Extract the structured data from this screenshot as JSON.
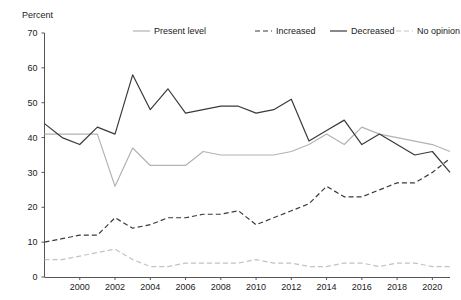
{
  "chart_data": {
    "type": "line",
    "title": "",
    "ylabel": "Percent",
    "xlabel": "",
    "ylim": [
      0,
      70
    ],
    "yticks": [
      0,
      10,
      20,
      30,
      40,
      50,
      60,
      70
    ],
    "xlim": [
      1998,
      2021
    ],
    "xticks": [
      2000,
      2002,
      2004,
      2006,
      2008,
      2010,
      2012,
      2014,
      2016,
      2018,
      2020
    ],
    "grid": false,
    "legend_position": "top",
    "x": [
      1998,
      1999,
      2000,
      2001,
      2002,
      2003,
      2004,
      2005,
      2006,
      2007,
      2008,
      2009,
      2010,
      2011,
      2012,
      2013,
      2014,
      2015,
      2016,
      2017,
      2018,
      2019,
      2020,
      2021
    ],
    "series": [
      {
        "name": "Present level",
        "key": "present_level",
        "style": "solid",
        "color": "#b3b3b3",
        "values": [
          41,
          41,
          41,
          41,
          26,
          37,
          32,
          32,
          32,
          36,
          35,
          35,
          35,
          35,
          36,
          38,
          41,
          38,
          43,
          41,
          40,
          39,
          38,
          36
        ]
      },
      {
        "name": "Increased",
        "key": "increased",
        "style": "dashed",
        "color": "#3a3a3a",
        "values": [
          10,
          11,
          12,
          12,
          17,
          14,
          15,
          17,
          17,
          18,
          18,
          19,
          15,
          17,
          19,
          21,
          26,
          23,
          23,
          25,
          27,
          27,
          30,
          34
        ]
      },
      {
        "name": "Decreased",
        "key": "decreased",
        "style": "solid",
        "color": "#3a3a3a",
        "values": [
          44,
          40,
          38,
          43,
          41,
          58,
          48,
          54,
          47,
          48,
          49,
          49,
          47,
          48,
          51,
          39,
          42,
          45,
          38,
          41,
          38,
          35,
          36,
          30
        ]
      },
      {
        "name": "No opinion",
        "key": "no_opinion",
        "style": "dashed",
        "color": "#c2c2c2",
        "values": [
          5,
          5,
          6,
          7,
          8,
          5,
          3,
          3,
          4,
          4,
          4,
          4,
          5,
          4,
          4,
          3,
          3,
          4,
          4,
          3,
          4,
          4,
          3,
          3
        ]
      }
    ],
    "legend": [
      {
        "label": "Present level",
        "style": "solid",
        "color": "#b3b3b3"
      },
      {
        "label": "Increased",
        "style": "dashed",
        "color": "#3a3a3a"
      },
      {
        "label": "Decreased",
        "style": "solid",
        "color": "#3a3a3a"
      },
      {
        "label": "No opinion",
        "style": "dashed",
        "color": "#c2c2c2"
      }
    ]
  },
  "axis": {
    "y_title": "Percent"
  }
}
